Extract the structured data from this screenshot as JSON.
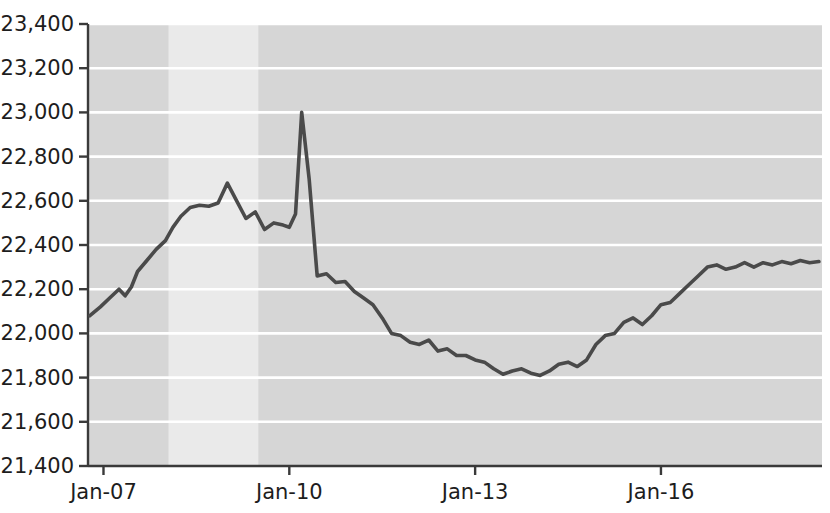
{
  "chart_data": {
    "type": "line",
    "title": "",
    "xlabel": "",
    "ylabel": "",
    "ylim": [
      21400,
      23400
    ],
    "ytick_values": [
      21400,
      21600,
      21800,
      22000,
      22200,
      22400,
      22600,
      22800,
      23000,
      23200,
      23400
    ],
    "ytick_labels": [
      "21,400",
      "21,600",
      "21,800",
      "22,000",
      "22,200",
      "22,400",
      "22,600",
      "22,800",
      "23,000",
      "23,200",
      "23,400"
    ],
    "xtick_labels": [
      "Jan-07",
      "Jan-10",
      "Jan-13",
      "Jan-16"
    ],
    "xtick_values": [
      2007.0,
      2010.0,
      2013.0,
      2016.0
    ],
    "xlim": [
      2006.75,
      2018.6
    ],
    "grid": "horizontal-only",
    "legend": "none",
    "plot_background": "#d6d6d6",
    "gridline_color": "#ffffff",
    "line_color": "#4a4a4a",
    "axis_color": "#3a3a3a",
    "shaded_bands": [
      {
        "from": 2008.05,
        "to": 2009.5,
        "color": "#eaeaea"
      }
    ],
    "series": [
      {
        "name": "series-1",
        "x": [
          2006.78,
          2006.95,
          2007.1,
          2007.25,
          2007.35,
          2007.45,
          2007.55,
          2007.7,
          2007.85,
          2008.0,
          2008.12,
          2008.25,
          2008.4,
          2008.55,
          2008.7,
          2008.85,
          2009.0,
          2009.15,
          2009.3,
          2009.45,
          2009.6,
          2009.75,
          2009.9,
          2010.0,
          2010.1,
          2010.2,
          2010.32,
          2010.45,
          2010.6,
          2010.75,
          2010.9,
          2011.05,
          2011.2,
          2011.35,
          2011.5,
          2011.65,
          2011.8,
          2011.95,
          2012.1,
          2012.25,
          2012.4,
          2012.55,
          2012.7,
          2012.85,
          2013.0,
          2013.15,
          2013.3,
          2013.45,
          2013.6,
          2013.75,
          2013.9,
          2014.05,
          2014.2,
          2014.35,
          2014.5,
          2014.65,
          2014.8,
          2014.95,
          2015.1,
          2015.25,
          2015.4,
          2015.55,
          2015.7,
          2015.85,
          2016.0,
          2016.15,
          2016.3,
          2016.45,
          2016.6,
          2016.75,
          2016.9,
          2017.05,
          2017.2,
          2017.35,
          2017.5,
          2017.65,
          2017.8,
          2017.95,
          2018.1,
          2018.25,
          2018.4,
          2018.55
        ],
        "y": [
          22080,
          22120,
          22160,
          22200,
          22170,
          22210,
          22280,
          22330,
          22380,
          22420,
          22480,
          22530,
          22570,
          22580,
          22575,
          22590,
          22680,
          22600,
          22520,
          22550,
          22470,
          22500,
          22490,
          22480,
          22540,
          23000,
          22700,
          22260,
          22270,
          22230,
          22235,
          22190,
          22160,
          22130,
          22070,
          22000,
          21990,
          21960,
          21950,
          21970,
          21920,
          21930,
          21900,
          21900,
          21880,
          21870,
          21840,
          21815,
          21830,
          21840,
          21820,
          21810,
          21830,
          21860,
          21870,
          21850,
          21880,
          21950,
          21990,
          22000,
          22050,
          22070,
          22040,
          22080,
          22130,
          22140,
          22180,
          22220,
          22260,
          22300,
          22310,
          22290,
          22300,
          22320,
          22300,
          22320,
          22310,
          22325,
          22315,
          22330,
          22320,
          22325
        ]
      }
    ]
  }
}
